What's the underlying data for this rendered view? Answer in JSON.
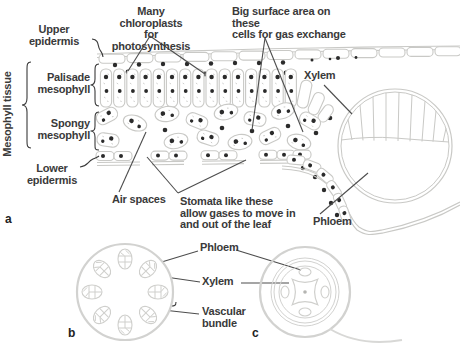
{
  "figure": {
    "panels": {
      "a": "a",
      "b": "b",
      "c": "c"
    },
    "leaf_labels": {
      "upper_epidermis": "Upper\nepidermis",
      "mesophyll_tissue": "Mesophyll tissue",
      "palisade_mesophyll": "Palisade\nmesophyll",
      "spongy_mesophyll": "Spongy\nmesophyll",
      "lower_epidermis": "Lower\nepidermis",
      "many_chloroplasts": "Many chloroplasts\nfor photosynthesis",
      "big_surface_area": "Big surface area on these\ncells for gas exchange",
      "xylem": "Xylem",
      "phloem": "Phloem",
      "air_spaces": "Air spaces",
      "stomata": "Stomata like these\nallow gases to move in\nand out of the leaf"
    },
    "cross_section_labels": {
      "phloem": "Phloem",
      "xylem": "Xylem",
      "vascular_bundle": "Vascular\nbundle"
    },
    "colors": {
      "background": "#ffffff",
      "cell_outline": "#c9c9c6",
      "chloroplast_dot": "#2b2b2b",
      "leader_line": "#4d4d4d",
      "text": "#3a3a3a"
    }
  }
}
